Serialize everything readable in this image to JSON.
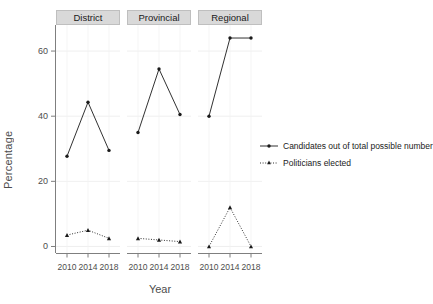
{
  "chart_data": {
    "type": "line",
    "title": "",
    "xlabel": "Year",
    "ylabel": "Percentage",
    "x": [
      2010,
      2014,
      2018
    ],
    "xtick_labels": [
      "2010",
      "2014",
      "2018"
    ],
    "ytick_labels": [
      "0",
      "20",
      "40",
      "60"
    ],
    "yticks": [
      0,
      20,
      40,
      60
    ],
    "ylim": [
      -2,
      68
    ],
    "grid": true,
    "legend_position": "right",
    "panels": [
      {
        "label": "District",
        "series": [
          {
            "name": "Candidates out of total possible number",
            "values": [
              27.7,
              44.3,
              29.5
            ]
          },
          {
            "name": "Politicians elected",
            "values": [
              3.5,
              5.0,
              2.5
            ]
          }
        ]
      },
      {
        "label": "Provincial",
        "series": [
          {
            "name": "Candidates out of total possible number",
            "values": [
              35.0,
              54.5,
              40.5
            ]
          },
          {
            "name": "Politicians elected",
            "values": [
              2.5,
              2.0,
              1.5
            ]
          }
        ]
      },
      {
        "label": "Regional",
        "series": [
          {
            "name": "Candidates out of total possible number",
            "values": [
              40.0,
              64.0,
              64.0
            ]
          },
          {
            "name": "Politicians elected",
            "values": [
              0.0,
              12.0,
              0.0
            ]
          }
        ]
      }
    ],
    "legend": [
      {
        "label": "Candidates out of total possible number",
        "style": "solid",
        "marker": "circle",
        "color": "#1a1a1a"
      },
      {
        "label": "Politicians elected",
        "style": "dotted",
        "marker": "triangle",
        "color": "#1a1a1a"
      }
    ]
  }
}
